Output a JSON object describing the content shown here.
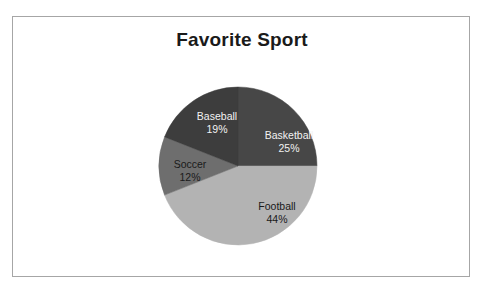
{
  "page": {
    "clipped_top_text": "·                    ·                                        ·        ·",
    "background_color": "#ffffff",
    "frame_border_color": "#a6a6a6"
  },
  "chart_data": {
    "type": "pie",
    "title": "Favorite Sport",
    "categories": [
      "Basketball",
      "Football",
      "Soccer",
      "Baseball"
    ],
    "values": [
      25,
      44,
      12,
      19
    ],
    "value_suffix": "%",
    "start_angle": 0,
    "direction": "clockwise",
    "legend": "none",
    "grid": false,
    "slices": [
      {
        "label": "Basketball",
        "value": 25,
        "percent_text": "25%",
        "color": "#474747",
        "label_color": "#f2f2f2",
        "label_theme": "label-light"
      },
      {
        "label": "Football",
        "value": 44,
        "percent_text": "44%",
        "color": "#b3b3b3",
        "label_color": "#1a1a1a",
        "label_theme": "label-dark"
      },
      {
        "label": "Soccer",
        "value": 12,
        "percent_text": "12%",
        "color": "#6e6e6e",
        "label_color": "#1a1a1a",
        "label_theme": "label-dark"
      },
      {
        "label": "Baseball",
        "value": 19,
        "percent_text": "19%",
        "color": "#3d3d3d",
        "label_color": "#f2f2f2",
        "label_theme": "label-light"
      }
    ],
    "geometry": {
      "center_x": 80,
      "center_y": 80,
      "radius": 79
    }
  }
}
